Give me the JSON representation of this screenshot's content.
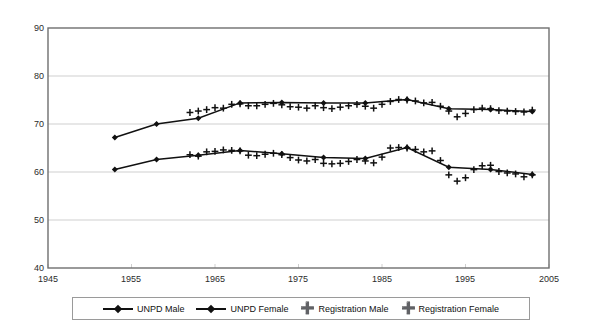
{
  "chart_data": {
    "type": "line",
    "title": "",
    "subtitle": "",
    "xlabel": "",
    "ylabel": "",
    "xlim": [
      1945,
      2005
    ],
    "ylim": [
      40,
      90
    ],
    "x_ticks": [
      1945,
      1955,
      1965,
      1975,
      1985,
      1995,
      2005
    ],
    "y_ticks": [
      40,
      50,
      60,
      70,
      80,
      90
    ],
    "grid": "horizontal",
    "legend_position": "bottom",
    "series": [
      {
        "name": "UNPD Male",
        "marker": "diamond",
        "line": "solid",
        "color": "#111111",
        "x": [
          1953,
          1958,
          1963,
          1968,
          1973,
          1978,
          1983,
          1988,
          1993,
          1998,
          2003
        ],
        "values": [
          60.5,
          62.6,
          63.5,
          64.5,
          63.8,
          63.0,
          62.8,
          65.1,
          61.0,
          60.5,
          59.5
        ]
      },
      {
        "name": "UNPD Female",
        "marker": "diamond",
        "line": "solid",
        "color": "#111111",
        "x": [
          1953,
          1958,
          1963,
          1968,
          1973,
          1978,
          1983,
          1988,
          1993,
          1998,
          2003
        ],
        "values": [
          67.2,
          70.0,
          71.2,
          74.4,
          74.5,
          74.4,
          74.4,
          75.1,
          73.2,
          73.0,
          72.6
        ]
      },
      {
        "name": "Registration Male",
        "marker": "plus",
        "line": "none",
        "color": "#111111",
        "x": [
          1962,
          1963,
          1964,
          1965,
          1966,
          1967,
          1968,
          1969,
          1970,
          1971,
          1972,
          1973,
          1974,
          1975,
          1976,
          1977,
          1978,
          1979,
          1980,
          1981,
          1982,
          1983,
          1984,
          1985,
          1986,
          1987,
          1988,
          1989,
          1990,
          1991,
          1992,
          1993,
          1994,
          1995,
          1996,
          1997,
          1998,
          1999,
          2000,
          2001,
          2002,
          2003
        ],
        "values": [
          63.6,
          63.3,
          64.2,
          64.3,
          64.6,
          64.5,
          64.4,
          63.5,
          63.4,
          63.7,
          63.9,
          63.6,
          63.0,
          62.5,
          62.3,
          62.6,
          61.8,
          61.7,
          61.8,
          62.2,
          62.6,
          62.3,
          61.9,
          63.1,
          65.0,
          65.1,
          65.0,
          64.7,
          64.2,
          64.4,
          62.4,
          59.4,
          58.1,
          58.8,
          60.5,
          61.3,
          61.4,
          60.1,
          59.8,
          59.6,
          59.0,
          59.4
        ]
      },
      {
        "name": "Registration Female",
        "marker": "plus",
        "line": "none",
        "color": "#111111",
        "x": [
          1962,
          1963,
          1964,
          1965,
          1966,
          1967,
          1968,
          1969,
          1970,
          1971,
          1972,
          1973,
          1974,
          1975,
          1976,
          1977,
          1978,
          1979,
          1980,
          1981,
          1982,
          1983,
          1984,
          1985,
          1986,
          1987,
          1988,
          1989,
          1990,
          1991,
          1992,
          1993,
          1994,
          1995,
          1996,
          1997,
          1998,
          1999,
          2000,
          2001,
          2002,
          2003
        ],
        "values": [
          72.4,
          72.7,
          73.0,
          73.4,
          73.3,
          74.1,
          74.2,
          73.8,
          73.8,
          74.1,
          74.3,
          74.0,
          73.6,
          73.5,
          73.3,
          73.8,
          73.4,
          73.2,
          73.5,
          73.8,
          74.1,
          73.7,
          73.3,
          74.1,
          74.7,
          75.1,
          75.0,
          74.8,
          74.4,
          74.5,
          73.7,
          72.7,
          71.5,
          72.2,
          73.0,
          73.3,
          73.2,
          72.8,
          72.7,
          72.6,
          72.5,
          72.9
        ]
      }
    ]
  },
  "axes": {
    "y_tick_labels": [
      "90",
      "80",
      "70",
      "60",
      "50",
      "40"
    ],
    "x_tick_labels": [
      "1945",
      "1955",
      "1965",
      "1975",
      "1985",
      "1995",
      "2005"
    ]
  },
  "legend": {
    "entries": [
      {
        "label": "UNPD Male",
        "marker": "line-diamond"
      },
      {
        "label": "UNPD Female",
        "marker": "line-diamond"
      },
      {
        "label": "Registration Male",
        "marker": "plus"
      },
      {
        "label": "Registration Female",
        "marker": "plus"
      }
    ]
  },
  "colors": {
    "ink": "#111111",
    "grid": "#cfcfcf",
    "frame": "#6f6f6f",
    "background": "#ffffff"
  }
}
